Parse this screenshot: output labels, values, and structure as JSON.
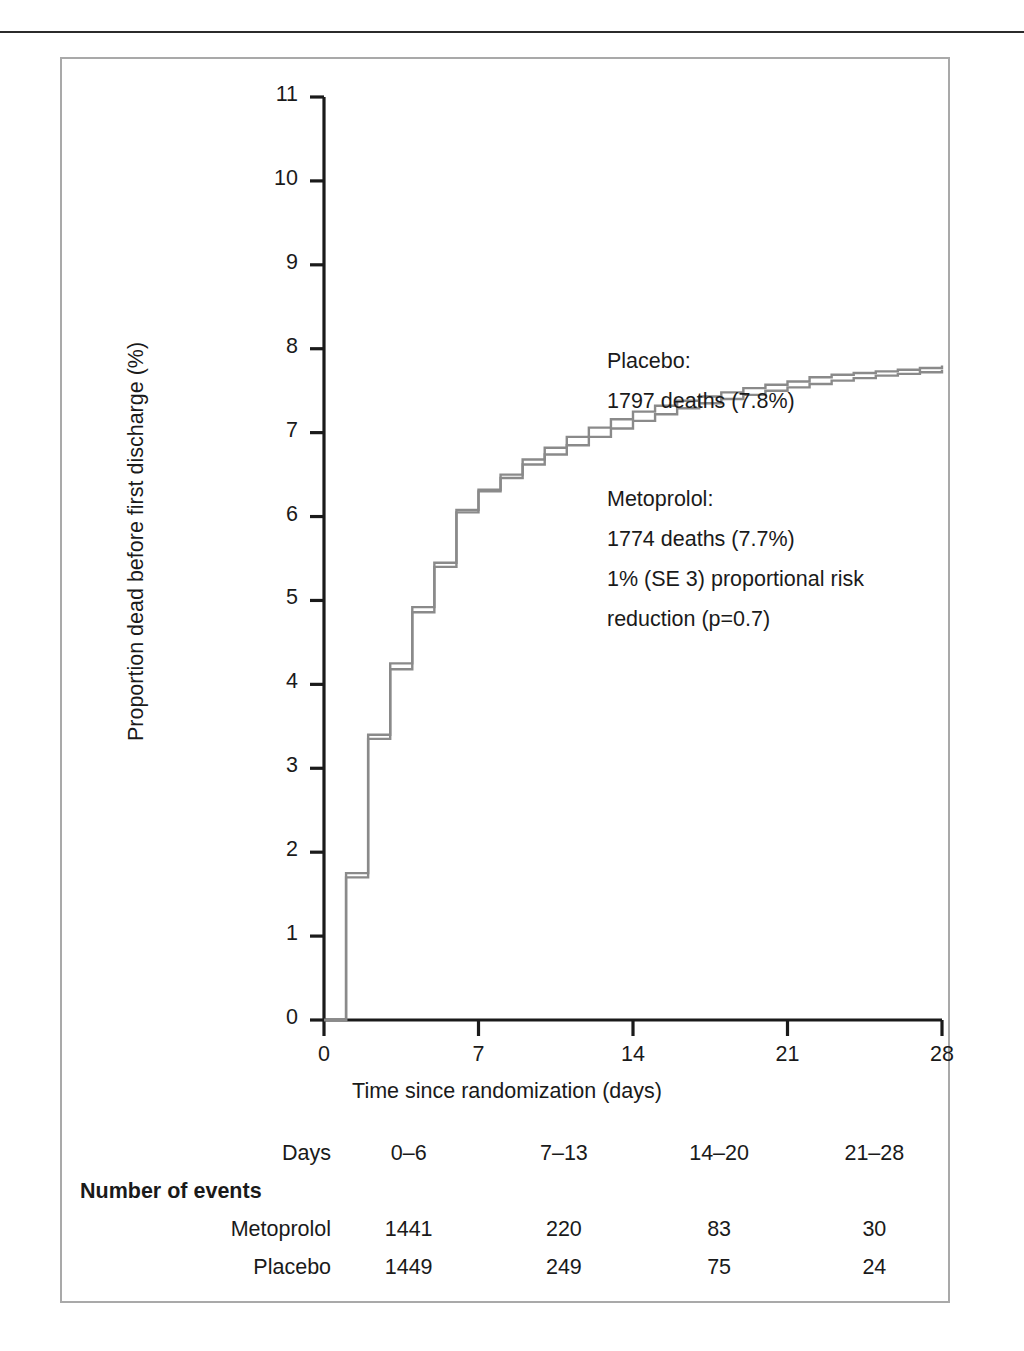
{
  "figure": {
    "y_axis_title": "Proportion dead before first discharge (%)",
    "x_axis_title": "Time since randomization (days)"
  },
  "annotations": {
    "placebo_title": "Placebo:",
    "placebo_deaths": "1797 deaths (7.8%)",
    "metoprolol_title": "Metoprolol:",
    "metoprolol_deaths": "1774 deaths (7.7%)",
    "risk_line1": "1% (SE 3) proportional risk",
    "risk_line2": "reduction (p=0.7)"
  },
  "table": {
    "header_label": "Days",
    "section_label": "Number of events",
    "columns": [
      "0–6",
      "7–13",
      "14–20",
      "21–28"
    ],
    "rows": [
      {
        "label": "Metoprolol",
        "values": [
          "1441",
          "220",
          "83",
          "30"
        ]
      },
      {
        "label": "Placebo",
        "values": [
          "1449",
          "249",
          "75",
          "24"
        ]
      }
    ]
  },
  "chart_data": {
    "type": "line",
    "title": "",
    "xlabel": "Time since randomization (days)",
    "ylabel": "Proportion dead before first discharge (%)",
    "xlim": [
      0,
      28
    ],
    "ylim": [
      0,
      11
    ],
    "xticks": [
      0,
      7,
      14,
      21,
      28
    ],
    "yticks": [
      0,
      1,
      2,
      3,
      4,
      5,
      6,
      7,
      8,
      9,
      10,
      11
    ],
    "grid": false,
    "legend": "annotation",
    "step_style": "post",
    "line_color": "#8a8a8a",
    "series": [
      {
        "name": "Placebo",
        "total_deaths": 1797,
        "final_percent": 7.8,
        "x": [
          0,
          1,
          2,
          3,
          4,
          5,
          6,
          7,
          8,
          9,
          10,
          11,
          12,
          13,
          14,
          15,
          16,
          17,
          18,
          19,
          20,
          21,
          22,
          23,
          24,
          25,
          26,
          27,
          28
        ],
        "values": [
          0,
          1.75,
          3.4,
          4.25,
          4.92,
          5.45,
          6.08,
          6.32,
          6.5,
          6.68,
          6.82,
          6.95,
          7.06,
          7.16,
          7.25,
          7.32,
          7.38,
          7.43,
          7.48,
          7.53,
          7.57,
          7.61,
          7.66,
          7.69,
          7.71,
          7.73,
          7.75,
          7.77,
          7.8
        ]
      },
      {
        "name": "Metoprolol",
        "total_deaths": 1774,
        "final_percent": 7.7,
        "x": [
          0,
          1,
          2,
          3,
          4,
          5,
          6,
          7,
          8,
          9,
          10,
          11,
          12,
          13,
          14,
          15,
          16,
          17,
          18,
          19,
          20,
          21,
          22,
          23,
          24,
          25,
          26,
          27,
          28
        ],
        "values": [
          0,
          1.7,
          3.35,
          4.18,
          4.86,
          5.4,
          6.05,
          6.3,
          6.46,
          6.62,
          6.74,
          6.85,
          6.95,
          7.05,
          7.14,
          7.22,
          7.29,
          7.35,
          7.4,
          7.45,
          7.5,
          7.54,
          7.58,
          7.62,
          7.65,
          7.68,
          7.7,
          7.72,
          7.75
        ]
      }
    ],
    "annotations": [
      "Placebo: 1797 deaths (7.8%)",
      "Metoprolol: 1774 deaths (7.7%)",
      "1% (SE 3) proportional risk reduction (p=0.7)"
    ],
    "events_table": {
      "columns": [
        "0–6",
        "7–13",
        "14–20",
        "21–28"
      ],
      "Metoprolol": [
        1441,
        220,
        83,
        30
      ],
      "Placebo": [
        1449,
        249,
        75,
        24
      ]
    }
  }
}
